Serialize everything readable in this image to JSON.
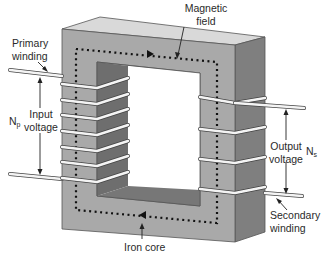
{
  "diagram": {
    "labels": {
      "magnetic_field_line1": "Magnetic",
      "magnetic_field_line2": "field",
      "primary_winding_line1": "Primary",
      "primary_winding_line2": "winding",
      "input_voltage_line1": "Input",
      "input_voltage_line2": "voltage",
      "np_main": "N",
      "np_sub": "p",
      "output_voltage_line1": "Output",
      "output_voltage_line2": "voltage",
      "ns_main": "N",
      "ns_sub": "s",
      "secondary_winding_line1": "Secondary",
      "secondary_winding_line2": "winding",
      "iron_core": "Iron core"
    },
    "components": {
      "core": "iron core (rectangular, shown in 3D)",
      "primary_coil_turns": 7,
      "secondary_coil_turns": 4,
      "flux_path": "dotted loop with arrows (clockwise)"
    },
    "colors": {
      "core_front": "#a9a9a9",
      "core_top": "#d9d9d9",
      "core_side": "#7f7f7f",
      "core_inner_dark": "#6e6e6e",
      "wire": "#f4f4f4",
      "text": "#2a2a2a"
    }
  }
}
